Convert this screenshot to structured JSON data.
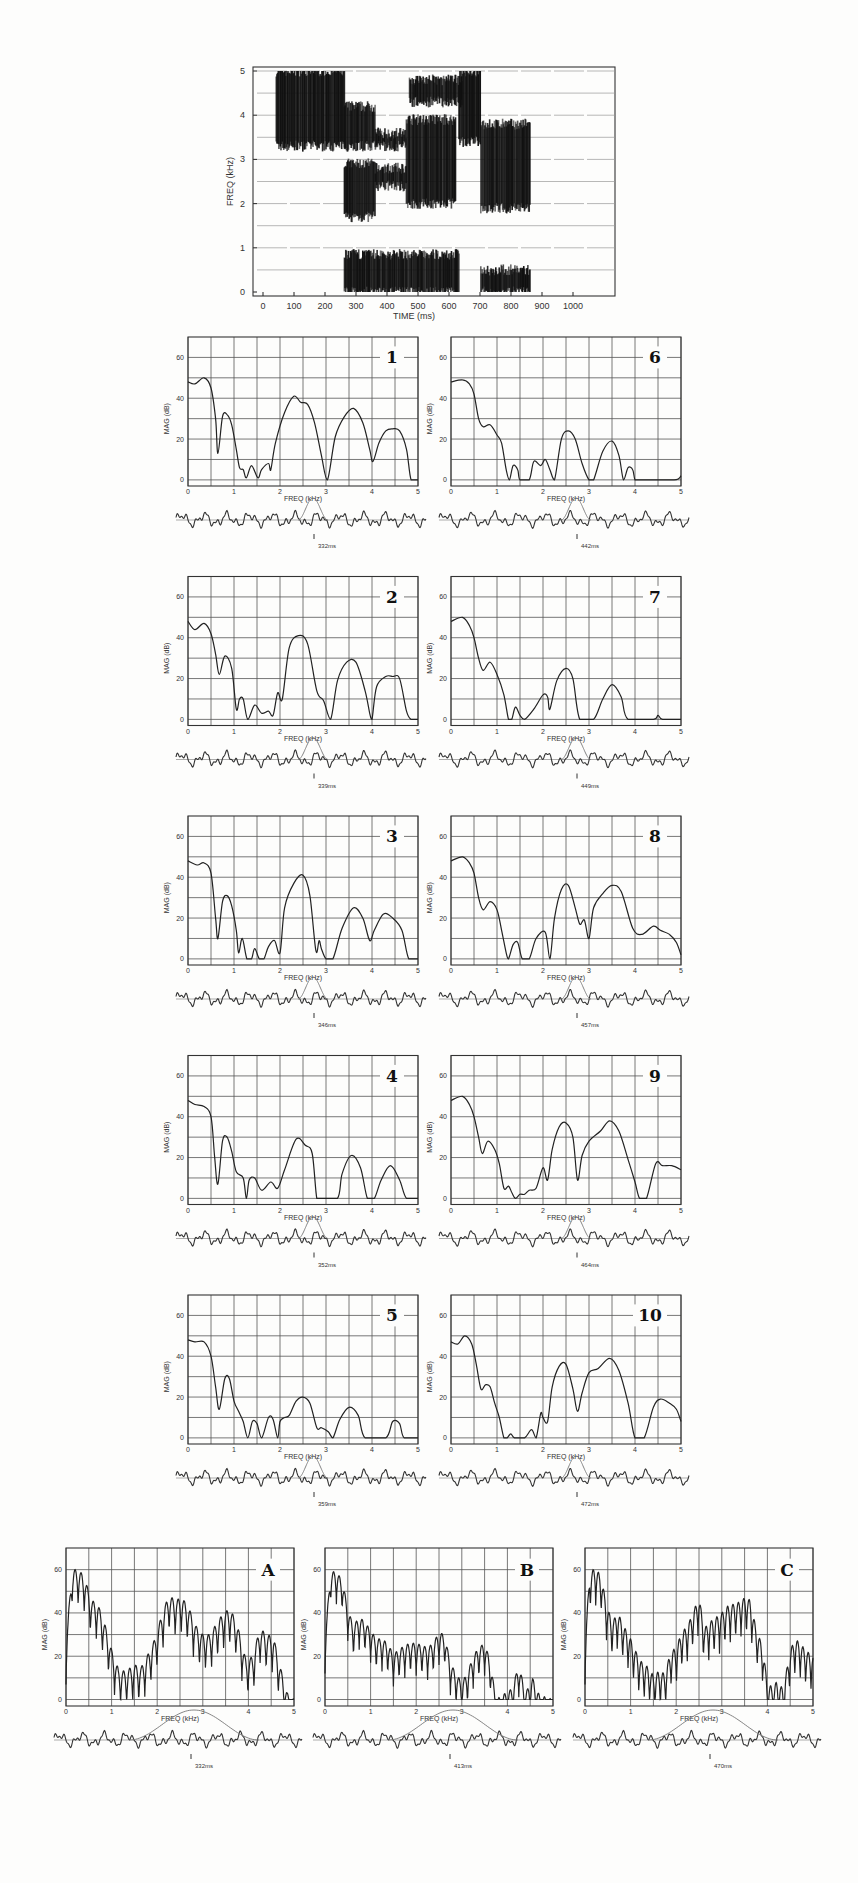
{
  "chart_data": [
    {
      "type": "heatmap",
      "name": "spectrogram",
      "title": "",
      "xlabel": "TIME  (ms)",
      "ylabel": "FREQ  (kHz)",
      "xlim": [
        0,
        1060
      ],
      "ylim": [
        0,
        5
      ],
      "xticks": [
        0,
        100,
        200,
        300,
        400,
        500,
        600,
        700,
        800,
        900,
        1000
      ],
      "yticks": [
        0,
        1,
        2,
        3,
        4,
        5
      ],
      "regions": [
        {
          "t": [
            40,
            260
          ],
          "f": [
            3.3,
            5.0
          ],
          "label": "fricative"
        },
        {
          "t": [
            260,
            360
          ],
          "f": [
            3.3,
            4.2
          ]
        },
        {
          "t": [
            260,
            360
          ],
          "f": [
            1.7,
            2.9
          ]
        },
        {
          "t": [
            360,
            460
          ],
          "f": [
            2.4,
            2.8
          ]
        },
        {
          "t": [
            360,
            460
          ],
          "f": [
            3.3,
            3.6
          ]
        },
        {
          "t": [
            460,
            620
          ],
          "f": [
            2.0,
            3.9
          ]
        },
        {
          "t": [
            470,
            640
          ],
          "f": [
            4.3,
            4.8
          ]
        },
        {
          "t": [
            630,
            700
          ],
          "f": [
            3.4,
            5.0
          ]
        },
        {
          "t": [
            700,
            860
          ],
          "f": [
            1.9,
            3.8
          ]
        },
        {
          "t": [
            260,
            630
          ],
          "f": [
            0.0,
            0.85
          ]
        },
        {
          "t": [
            700,
            860
          ],
          "f": [
            0.0,
            0.5
          ]
        }
      ]
    },
    {
      "type": "line",
      "label": "1",
      "time": "332ms",
      "xlabel": "FREQ (kHz)",
      "ylabel": "MAG  (dB)",
      "xlim": [
        0,
        5
      ],
      "ylim": [
        -3,
        70
      ],
      "xticks": [
        0,
        1,
        2,
        3,
        4,
        5
      ],
      "yticks": [
        0,
        20,
        40,
        60
      ],
      "x": [
        0,
        0.15,
        0.35,
        0.5,
        0.6,
        0.65,
        0.75,
        0.85,
        0.95,
        1.05,
        1.12,
        1.2,
        1.27,
        1.38,
        1.52,
        1.6,
        1.75,
        1.8,
        1.9,
        2.1,
        2.3,
        2.45,
        2.6,
        2.75,
        2.9,
        3.03,
        3.2,
        3.4,
        3.6,
        3.8,
        3.95,
        4.02,
        4.15,
        4.3,
        4.45,
        4.6,
        4.75,
        4.85,
        5
      ],
      "y": [
        48,
        47,
        50,
        45,
        30,
        13,
        31,
        32,
        27,
        15,
        6,
        5,
        1,
        7,
        1,
        5,
        8,
        5,
        18,
        33,
        41,
        38,
        37,
        28,
        12,
        0,
        21,
        31,
        35,
        28,
        15,
        9,
        18,
        24,
        25,
        24,
        15,
        0,
        0
      ]
    },
    {
      "type": "line",
      "label": "2",
      "time": "339ms",
      "x": [
        0,
        0.15,
        0.35,
        0.5,
        0.6,
        0.68,
        0.8,
        0.95,
        1.05,
        1.12,
        1.2,
        1.3,
        1.45,
        1.6,
        1.75,
        1.85,
        1.95,
        2.05,
        2.2,
        2.4,
        2.6,
        2.8,
        2.95,
        3.1,
        3.25,
        3.45,
        3.65,
        3.85,
        3.95,
        4.0,
        4.1,
        4.3,
        4.45,
        4.6,
        4.75,
        4.85,
        5
      ],
      "y": [
        48,
        44,
        47,
        42,
        32,
        22,
        31,
        25,
        5,
        10,
        10,
        0,
        7,
        3,
        4,
        2,
        13,
        10,
        35,
        41,
        37,
        14,
        9,
        0,
        19,
        28,
        28,
        14,
        3,
        0,
        16,
        21,
        21,
        20,
        4,
        0,
        0
      ]
    },
    {
      "type": "line",
      "label": "3",
      "time": "346ms",
      "x": [
        0,
        0.2,
        0.35,
        0.5,
        0.6,
        0.65,
        0.75,
        0.85,
        0.95,
        1.05,
        1.1,
        1.18,
        1.28,
        1.38,
        1.45,
        1.55,
        1.65,
        1.75,
        1.88,
        2.0,
        2.1,
        2.3,
        2.5,
        2.65,
        2.78,
        2.85,
        2.9,
        3.0,
        3.15,
        3.35,
        3.6,
        3.8,
        3.95,
        4.05,
        4.25,
        4.45,
        4.65,
        4.8,
        5
      ],
      "y": [
        48,
        46,
        47,
        42,
        20,
        10,
        28,
        31,
        26,
        14,
        3,
        10,
        0,
        0,
        5,
        0,
        0,
        6,
        9,
        3,
        25,
        37,
        41,
        31,
        4,
        9,
        5,
        0,
        0,
        15,
        25,
        20,
        9,
        14,
        22,
        20,
        14,
        0,
        0
      ]
    },
    {
      "type": "line",
      "label": "4",
      "time": "352ms",
      "x": [
        0,
        0.15,
        0.35,
        0.5,
        0.58,
        0.65,
        0.75,
        0.85,
        0.95,
        1.05,
        1.2,
        1.27,
        1.33,
        1.45,
        1.6,
        1.8,
        1.95,
        2.1,
        2.35,
        2.55,
        2.7,
        2.8,
        2.9,
        3.25,
        3.35,
        3.55,
        3.75,
        3.9,
        4.05,
        4.2,
        4.4,
        4.6,
        4.75,
        5
      ],
      "y": [
        48,
        46,
        45,
        40,
        20,
        7,
        28,
        30,
        23,
        13,
        10,
        0,
        9,
        10,
        4,
        8,
        5,
        14,
        29,
        26,
        22,
        0,
        0,
        0,
        12,
        21,
        15,
        0,
        0,
        9,
        16,
        9,
        0,
        0
      ]
    },
    {
      "type": "line",
      "label": "5",
      "time": "359ms",
      "x": [
        0,
        0.15,
        0.35,
        0.5,
        0.6,
        0.68,
        0.8,
        0.9,
        1.0,
        1.1,
        1.2,
        1.3,
        1.4,
        1.5,
        1.6,
        1.75,
        1.85,
        1.95,
        2.0,
        2.1,
        2.2,
        2.35,
        2.5,
        2.65,
        2.8,
        2.9,
        3.05,
        3.15,
        3.3,
        3.5,
        3.7,
        3.85,
        4.3,
        4.45,
        4.6,
        4.7,
        5
      ],
      "y": [
        48,
        47,
        47,
        40,
        25,
        14,
        29,
        29,
        18,
        13,
        8,
        0,
        8,
        7,
        0,
        10,
        9,
        0,
        8,
        10,
        11,
        18,
        20,
        17,
        5,
        5,
        3,
        0,
        9,
        15,
        11,
        0,
        0,
        8,
        7,
        0,
        0
      ]
    },
    {
      "type": "line",
      "label": "6",
      "time": "442ms",
      "x": [
        0,
        0.25,
        0.4,
        0.5,
        0.6,
        0.7,
        0.85,
        1.0,
        1.1,
        1.2,
        1.27,
        1.35,
        1.45,
        1.5,
        1.7,
        1.8,
        1.95,
        2.05,
        2.15,
        2.25,
        2.4,
        2.55,
        2.7,
        2.85,
        3.0,
        3.1,
        3.3,
        3.5,
        3.65,
        3.75,
        3.85,
        3.95,
        4.0,
        4.1,
        4.85,
        5
      ],
      "y": [
        48,
        49,
        47,
        42,
        30,
        26,
        27,
        22,
        18,
        5,
        0,
        7,
        5,
        0,
        0,
        9,
        7,
        10,
        5,
        0,
        20,
        24,
        20,
        8,
        0,
        0,
        14,
        19,
        12,
        0,
        6,
        5,
        0,
        0,
        0,
        2
      ]
    },
    {
      "type": "line",
      "label": "7",
      "time": "449ms",
      "x": [
        0,
        0.25,
        0.4,
        0.5,
        0.6,
        0.7,
        0.85,
        1.0,
        1.15,
        1.25,
        1.32,
        1.4,
        1.5,
        1.6,
        1.8,
        2.0,
        2.1,
        2.15,
        2.3,
        2.5,
        2.65,
        2.8,
        3.1,
        3.3,
        3.5,
        3.7,
        3.85,
        4.4,
        4.5,
        4.6,
        5
      ],
      "y": [
        48,
        50,
        46,
        40,
        30,
        24,
        28,
        22,
        12,
        0,
        0,
        6,
        2,
        0,
        5,
        12,
        11,
        5,
        19,
        25,
        20,
        0,
        0,
        10,
        17,
        11,
        0,
        0,
        2,
        0,
        0
      ]
    },
    {
      "type": "line",
      "label": "8",
      "time": "457ms",
      "x": [
        0,
        0.25,
        0.4,
        0.5,
        0.6,
        0.7,
        0.85,
        1.0,
        1.1,
        1.2,
        1.25,
        1.35,
        1.45,
        1.55,
        1.7,
        1.85,
        2.05,
        2.15,
        2.25,
        2.4,
        2.55,
        2.7,
        2.8,
        2.9,
        3.0,
        3.1,
        3.3,
        3.5,
        3.7,
        3.95,
        4.15,
        4.4,
        4.55,
        4.75,
        4.9,
        5
      ],
      "y": [
        48,
        50,
        47,
        42,
        30,
        24,
        28,
        24,
        14,
        3,
        0,
        7,
        8,
        0,
        0,
        10,
        13,
        0,
        20,
        34,
        36,
        25,
        17,
        19,
        10,
        25,
        32,
        36,
        33,
        15,
        12,
        16,
        14,
        12,
        8,
        2
      ]
    },
    {
      "type": "line",
      "label": "9",
      "time": "464ms",
      "x": [
        0,
        0.25,
        0.4,
        0.5,
        0.6,
        0.68,
        0.8,
        0.95,
        1.05,
        1.15,
        1.25,
        1.32,
        1.4,
        1.5,
        1.6,
        1.7,
        1.85,
        2.0,
        2.1,
        2.2,
        2.35,
        2.5,
        2.65,
        2.75,
        2.85,
        3.0,
        3.25,
        3.45,
        3.65,
        3.85,
        4.0,
        4.1,
        4.25,
        4.45,
        4.6,
        4.8,
        5
      ],
      "y": [
        48,
        50,
        46,
        40,
        30,
        22,
        28,
        24,
        17,
        5,
        6,
        3,
        0,
        2,
        2,
        4,
        5,
        15,
        9,
        24,
        35,
        37,
        30,
        9,
        21,
        28,
        33,
        38,
        33,
        19,
        8,
        0,
        0,
        17,
        16,
        16,
        14
      ]
    },
    {
      "type": "line",
      "label": "10",
      "time": "472ms",
      "x": [
        0,
        0.15,
        0.3,
        0.45,
        0.55,
        0.65,
        0.75,
        0.85,
        0.95,
        1.05,
        1.15,
        1.22,
        1.3,
        1.38,
        1.6,
        1.75,
        1.85,
        1.95,
        2.0,
        2.1,
        2.2,
        2.35,
        2.5,
        2.65,
        2.75,
        2.85,
        3.0,
        3.2,
        3.45,
        3.65,
        3.85,
        4.0,
        4.2,
        4.4,
        4.55,
        4.75,
        4.9,
        5
      ],
      "y": [
        47,
        46,
        50,
        46,
        36,
        24,
        26,
        25,
        17,
        10,
        0,
        0,
        2,
        0,
        0,
        4,
        0,
        12,
        10,
        8,
        25,
        35,
        36,
        24,
        13,
        22,
        32,
        34,
        39,
        33,
        17,
        0,
        0,
        15,
        19,
        17,
        14,
        8
      ]
    },
    {
      "type": "line",
      "label": "A",
      "time": "332ms",
      "harmonic_spacing_khz": 0.133,
      "x": [
        0,
        0.13,
        0.27,
        0.4,
        0.55,
        0.7,
        0.85,
        1.0,
        1.15,
        1.3,
        1.5,
        1.65,
        1.8,
        1.95,
        2.1,
        2.25,
        2.4,
        2.55,
        2.7,
        2.85,
        3.0,
        3.15,
        3.3,
        3.45,
        3.6,
        3.75,
        3.95,
        4.1,
        4.25,
        4.4,
        4.55,
        4.7,
        4.85,
        5
      ],
      "y": [
        25,
        60,
        60,
        57,
        46,
        44,
        35,
        23,
        14,
        13,
        16,
        15,
        21,
        28,
        39,
        48,
        46,
        47,
        42,
        34,
        30,
        30,
        35,
        40,
        42,
        35,
        18,
        20,
        33,
        30,
        29,
        15,
        3,
        0
      ],
      "trough_depth_db": 18
    },
    {
      "type": "line",
      "label": "B",
      "time": "413ms",
      "harmonic_spacing_khz": 0.125,
      "x": [
        0,
        0.12,
        0.25,
        0.38,
        0.5,
        0.62,
        0.75,
        0.87,
        1.0,
        1.12,
        1.25,
        1.37,
        1.5,
        1.62,
        1.75,
        1.87,
        2.0,
        2.12,
        2.25,
        2.37,
        2.5,
        2.62,
        2.75,
        2.87,
        3.0,
        3.12,
        3.25,
        3.37,
        3.5,
        3.62,
        3.75,
        4.1,
        4.25,
        4.4,
        4.55,
        4.7,
        5
      ],
      "y": [
        27,
        59,
        59,
        55,
        42,
        34,
        38,
        36,
        32,
        28,
        28,
        26,
        21,
        23,
        25,
        26,
        26,
        25,
        24,
        26,
        31,
        30,
        17,
        12,
        8,
        12,
        20,
        24,
        26,
        18,
        0,
        5,
        16,
        3,
        10,
        2,
        0
      ],
      "trough_depth_db": 15
    },
    {
      "type": "line",
      "label": "C",
      "time": "470ms",
      "harmonic_spacing_khz": 0.118,
      "x": [
        0,
        0.1,
        0.22,
        0.35,
        0.48,
        0.6,
        0.72,
        0.85,
        1.0,
        1.12,
        1.25,
        1.38,
        1.5,
        1.62,
        1.75,
        1.88,
        2.0,
        2.12,
        2.25,
        2.38,
        2.5,
        2.62,
        2.75,
        2.88,
        3.0,
        3.12,
        3.25,
        3.38,
        3.5,
        3.62,
        3.75,
        3.9,
        4.0,
        4.1,
        4.2,
        4.35,
        4.5,
        4.62,
        4.75,
        4.88,
        5
      ],
      "y": [
        25,
        58,
        61,
        57,
        43,
        36,
        40,
        34,
        28,
        22,
        17,
        15,
        11,
        13,
        12,
        22,
        24,
        31,
        34,
        41,
        47,
        33,
        36,
        38,
        40,
        43,
        44,
        45,
        47,
        46,
        33,
        24,
        7,
        6,
        8,
        5,
        23,
        28,
        25,
        22,
        20
      ],
      "trough_depth_db": 18
    }
  ],
  "labels": {
    "spec_xlabel": "TIME  (ms)",
    "spec_ylabel": "FREQ  (kHz)",
    "panel_xlabel": "FREQ (kHz)",
    "panel_ylabel": "MAG  (dB)"
  }
}
